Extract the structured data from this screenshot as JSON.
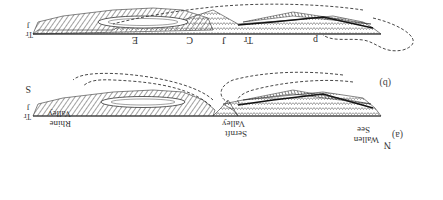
{
  "figure": {
    "orientation": "rotated-180",
    "panels": [
      {
        "id": "a",
        "label": "(a)",
        "directions": {
          "left": "N",
          "right": "S"
        },
        "valleys": [
          "Wallen See",
          "Sernft Valley",
          "Rhine Valley"
        ],
        "unit_labels": [
          "Tr",
          "J"
        ]
      },
      {
        "id": "b",
        "label": "(b)",
        "unit_labels": [
          "E",
          "C",
          "J",
          "Tr",
          "p",
          "Tr",
          "J"
        ]
      }
    ]
  },
  "labels": {
    "panel_a": "(a)",
    "panel_b": "(b)",
    "north": "N",
    "south": "S",
    "wallen_1": "Wallen",
    "wallen_2": "See",
    "sernft_1": "Sernft",
    "sernft_2": "Valley",
    "rhine_1": "Rhine",
    "rhine_2": "Valley",
    "b_E": "E",
    "b_C": "C",
    "b_J": "J",
    "b_Tr": "Tr",
    "b_p": "p",
    "b_Tr_end": "Tr",
    "b_J_end": "J",
    "a_Tr_end": "Tr",
    "a_J_end": "J"
  },
  "colors": {
    "ink": "#222222",
    "hatch": "#555555",
    "dash": "#333333",
    "bg": "#ffffff"
  }
}
